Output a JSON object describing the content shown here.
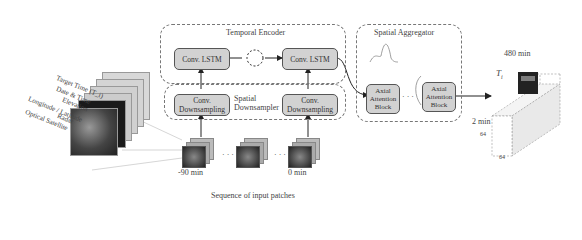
{
  "input_stack": {
    "labels": [
      "Target Time (T_i)",
      "Date & Time",
      "Elevation",
      "Longitude / Latitude",
      "Radar",
      "Optical Satellite"
    ]
  },
  "temporal_encoder": {
    "title": "Temporal Encoder",
    "blocks": [
      "Conv. LSTM",
      "Conv. LSTM"
    ]
  },
  "spatial_downsampler": {
    "title": "Spatial\nDownsampler",
    "title_line1": "Spatial",
    "title_line2": "Downsampler",
    "blocks": [
      "Conv.\nDownsampling",
      "Conv.\nDownsampling"
    ],
    "block_line1": "Conv.",
    "block_line2": "Downsampling"
  },
  "spatial_aggregator": {
    "title": "Spatial Aggregator",
    "block_line1": "Axial",
    "block_line2": "Attention",
    "block_line3": "Block",
    "ellipsis": "· · ·"
  },
  "patches": {
    "first_label": "-90 min",
    "last_label": "0 min",
    "ellipsis": "· · ·",
    "caption": "Sequence of input patches"
  },
  "output": {
    "target_label": "T_i",
    "target_main": "T",
    "target_sub": "i",
    "time_far": "480 min",
    "time_near": "2 min",
    "dim_h": "64",
    "dim_w": "64"
  }
}
